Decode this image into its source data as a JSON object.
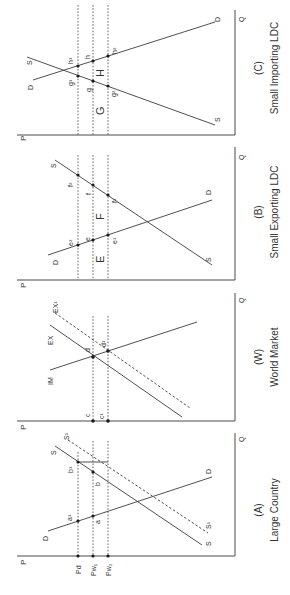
{
  "figure": {
    "rotation_deg": -90,
    "axis_labels": {
      "price": "P",
      "quantity": "Q"
    },
    "panels": [
      {
        "id": "C",
        "letter": "(C)",
        "title": "Small Importing LDC",
        "curve_labels": {
          "demand": "D",
          "supply": "S"
        },
        "points": [
          "h¹",
          "h",
          "h²",
          "g¹",
          "g",
          "g²"
        ],
        "areas": [
          "G",
          "H"
        ]
      },
      {
        "id": "B",
        "letter": "(B)",
        "title": "Small Exporting LDC",
        "curve_labels": {
          "demand": "D",
          "supply": "S"
        },
        "points": [
          "f²",
          "f",
          "f¹",
          "e²",
          "e",
          "e¹"
        ],
        "areas": [
          "E",
          "F"
        ]
      },
      {
        "id": "W",
        "letter": "(W)",
        "title": "World Market",
        "curve_labels": {
          "import_demand": "IM",
          "export_supply": "EX",
          "export_supply_shifted": "EX¹"
        },
        "points": [
          "d",
          "d¹",
          "c",
          "c¹"
        ]
      },
      {
        "id": "A",
        "letter": "(A)",
        "title": "Large Country",
        "curve_labels": {
          "demand": "D",
          "supply": "S",
          "supply_shifted": "S¹"
        },
        "points": [
          "a¹",
          "a",
          "b¹",
          "b"
        ],
        "price_ticks": [
          "Pd",
          "Pw₁",
          "Pw₂"
        ]
      }
    ]
  }
}
